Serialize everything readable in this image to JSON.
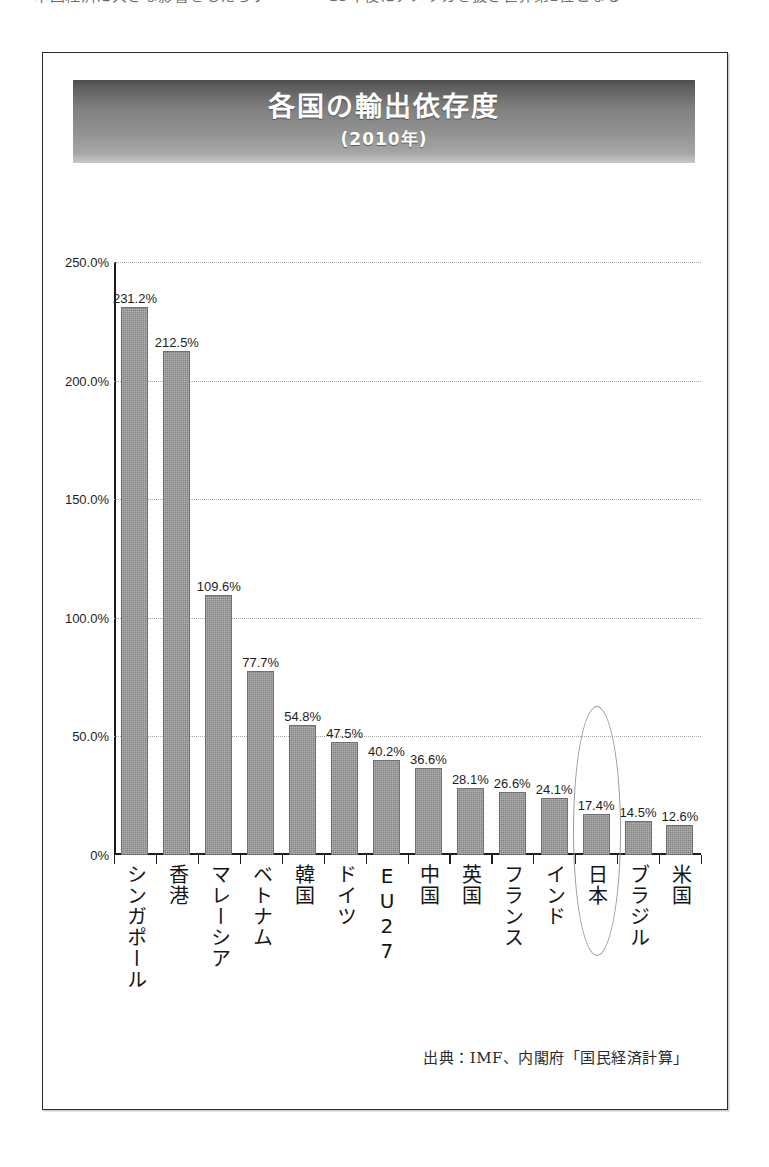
{
  "page": {
    "top_clipped_line": "本国経済に大きな影響をもたらす　　　　15年後にアメリカを抜き世界第1位となる"
  },
  "figure": {
    "title": "各国の輸出依存度",
    "subtitle": "(2010年)",
    "source_note": "出典：IMF、内閣府「国民経済計算」",
    "highlight_country": "日本"
  },
  "chart_data": {
    "type": "bar",
    "title": "各国の輸出依存度",
    "subtitle": "(2010年)",
    "xlabel": "",
    "ylabel": "",
    "ylim": [
      0,
      250
    ],
    "yunit": "%",
    "grid": true,
    "legend": "none",
    "orientation": "vertical",
    "categories": [
      "シンガポール",
      "香港",
      "マレーシア",
      "ベトナム",
      "韓国",
      "ドイツ",
      "EU27",
      "中国",
      "英国",
      "フランス",
      "インド",
      "日本",
      "ブラジル",
      "米国"
    ],
    "values": [
      231.2,
      212.5,
      109.6,
      77.7,
      54.8,
      47.5,
      40.2,
      36.6,
      28.1,
      26.6,
      24.1,
      17.4,
      14.5,
      12.6
    ],
    "value_labels": [
      "231.2%",
      "212.5%",
      "109.6%",
      "77.7%",
      "54.8%",
      "47.5%",
      "40.2%",
      "36.6%",
      "28.1%",
      "26.6%",
      "24.1%",
      "17.4%",
      "14.5%",
      "12.6%"
    ],
    "yticks": [
      0,
      50,
      100,
      150,
      200,
      250
    ],
    "ytick_labels": [
      "0%",
      "50.0%",
      "100.0%",
      "150.0%",
      "200.0%",
      "250.0%"
    ],
    "highlighted_category": "日本",
    "colors": {
      "bar": "#858585",
      "axis": "#1d1d1d",
      "grid": "#a9a9a9",
      "highlight": "#9a9a9a",
      "banner_dark": "#4c4c4c",
      "banner_light": "#c9c9c9"
    }
  }
}
